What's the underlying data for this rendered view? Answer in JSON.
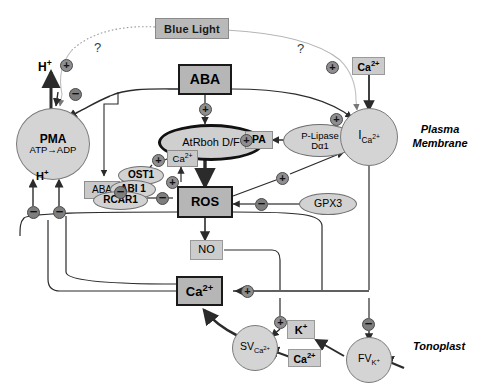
{
  "figure": {
    "type": "signaling-pathway-diagram",
    "compartments": [
      {
        "id": "plasma-membrane",
        "label": "Plasma\nMembrane",
        "line1": "Plasma",
        "line2": "Membrane"
      },
      {
        "id": "tonoplast",
        "label": "Tonoplast"
      }
    ]
  },
  "nodes": {
    "blue_light": {
      "label": "Blue Light",
      "shape": "banner",
      "fill": "#b9b9b9"
    },
    "aba_top": {
      "label": "ABA",
      "shape": "box-strong",
      "fill": "#b6b6b6"
    },
    "aba_left": {
      "label": "ABA",
      "shape": "box-soft",
      "fill": "#c9c9c9"
    },
    "pma": {
      "line1": "PMA",
      "line2": "ATP→ADP",
      "shape": "circle",
      "fill": "#d4d4d4"
    },
    "atrboh": {
      "label": "AtRboh D/F",
      "shape": "ellipse-strong",
      "fill": "#cfcfcf"
    },
    "pa": {
      "label": "PA",
      "shape": "box-soft",
      "fill": "#c9c9c9"
    },
    "ca_atrboh": {
      "label": "Ca2+",
      "base": "Ca",
      "sup": "2+",
      "shape": "box-soft",
      "fill": "#c9c9c9"
    },
    "p_lipase": {
      "line1": "P-Lipase",
      "line2": "Dα1",
      "shape": "ellipse",
      "fill": "#d2d2d2"
    },
    "i_ca": {
      "base": "I",
      "sub": "Ca2+",
      "label": "ICa2+",
      "shape": "circle",
      "fill": "#d4d4d4"
    },
    "ca_top_right": {
      "base": "Ca",
      "sup": "2+",
      "label": "Ca2+",
      "shape": "box-plain",
      "fill": "#cccccc"
    },
    "ost1": {
      "label": "OST1",
      "shape": "ellipse",
      "fill": "#d2d2d2"
    },
    "abi1": {
      "label": "ABI 1",
      "shape": "ellipse",
      "fill": "#d2d2d2"
    },
    "rcar1": {
      "label": "RCAR1",
      "shape": "ellipse",
      "fill": "#d2d2d2"
    },
    "ros": {
      "label": "ROS",
      "shape": "box-strong",
      "fill": "#b6b6b6"
    },
    "gpx3": {
      "label": "GPX3",
      "shape": "ellipse",
      "fill": "#d2d2d2"
    },
    "no": {
      "label": "NO",
      "shape": "box-plain",
      "fill": "#cccccc"
    },
    "ca_center": {
      "base": "Ca",
      "sup": "2+",
      "label": "Ca2+",
      "shape": "box-strong",
      "fill": "#b6b6b6"
    },
    "sv_ca": {
      "base": "SV",
      "sub": "Ca2+",
      "label": "SVCa2+",
      "shape": "circle",
      "fill": "#d4d4d4"
    },
    "fv_k": {
      "base": "FV",
      "sub": "K+",
      "label": "FVK+",
      "shape": "circle",
      "fill": "#d4d4d4"
    },
    "k_plus": {
      "base": "K",
      "sup": "+",
      "label": "K+",
      "shape": "box-plain",
      "fill": "#cccccc"
    },
    "ca_bottom": {
      "base": "Ca",
      "sup": "2+",
      "label": "Ca2+",
      "shape": "box-plain",
      "fill": "#cccccc"
    },
    "h_plus_out": {
      "base": "H",
      "sup": "+",
      "label": "H+",
      "shape": "text"
    },
    "h_plus_in": {
      "base": "H",
      "sup": "+",
      "label": "H+",
      "shape": "text"
    }
  },
  "annotations": {
    "question_left": "?",
    "question_right": "?"
  },
  "modifiers": {
    "plus": "+",
    "minus": "−",
    "list": [
      {
        "id": "mod-bluelight-pma",
        "sign": "+"
      },
      {
        "id": "mod-aba-pma",
        "sign": "−"
      },
      {
        "id": "mod-aba-atrboh",
        "sign": "+"
      },
      {
        "id": "mod-ost1-ca",
        "sign": "+"
      },
      {
        "id": "mod-rcar1-abi1",
        "sign": "−"
      },
      {
        "id": "mod-abi1-ros",
        "sign": "−"
      },
      {
        "id": "mod-ros-ca-gate",
        "sign": "+"
      },
      {
        "id": "mod-pma-inhibit-1",
        "sign": "−"
      },
      {
        "id": "mod-pma-inhibit-2",
        "sign": "−"
      },
      {
        "id": "mod-ros-ica",
        "sign": "+"
      },
      {
        "id": "mod-gpx3-ros",
        "sign": "−"
      },
      {
        "id": "mod-bluelight-ica",
        "sign": "+"
      },
      {
        "id": "mod-aba-ica",
        "sign": "+"
      },
      {
        "id": "mod-ca-release",
        "sign": "+"
      },
      {
        "id": "mod-sv-ca",
        "sign": "+"
      },
      {
        "id": "mod-fv-k",
        "sign": "−"
      }
    ]
  },
  "colors": {
    "stroke": "#2b2b2b",
    "light_stroke": "#9a9a9a",
    "box_strong_fill": "#b6b6b6",
    "box_soft_fill": "#c9c9c9",
    "ellipse_fill": "#d2d2d2",
    "mod_fill": "#8e8e8e",
    "background": "#ffffff"
  }
}
